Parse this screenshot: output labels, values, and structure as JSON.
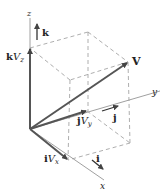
{
  "diagram": {
    "colors": {
      "vector": "#555555",
      "axis": "#888888",
      "dashed": "#999999",
      "text": "#222222"
    },
    "axes": {
      "x": "x",
      "y": "y",
      "z": "z"
    },
    "unit_vectors": {
      "i": "i",
      "j": "j",
      "k": "k"
    },
    "components": {
      "x": {
        "unit": "i",
        "symbol": "V",
        "sub": "x"
      },
      "y": {
        "unit": "j",
        "symbol": "V",
        "sub": "y"
      },
      "z": {
        "unit": "k",
        "symbol": "V",
        "sub": "z"
      }
    },
    "vector_label": "V"
  }
}
